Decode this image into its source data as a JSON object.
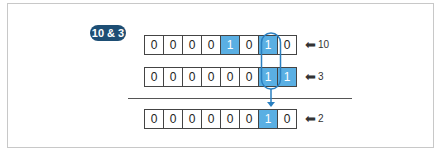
{
  "badge": "10 & 3",
  "rows": [
    {
      "bits": [
        "0",
        "0",
        "0",
        "0",
        "1",
        "0",
        "1",
        "0"
      ],
      "label": "10"
    },
    {
      "bits": [
        "0",
        "0",
        "0",
        "0",
        "0",
        "0",
        "1",
        "1"
      ],
      "label": "3"
    },
    {
      "bits": [
        "0",
        "0",
        "0",
        "0",
        "0",
        "0",
        "1",
        "0"
      ],
      "label": "2"
    }
  ],
  "arrow_glyph": "⟵",
  "colors": {
    "highlight": "#5aafe3",
    "badge": "#1d4e74",
    "connector": "#2a7fc0"
  }
}
